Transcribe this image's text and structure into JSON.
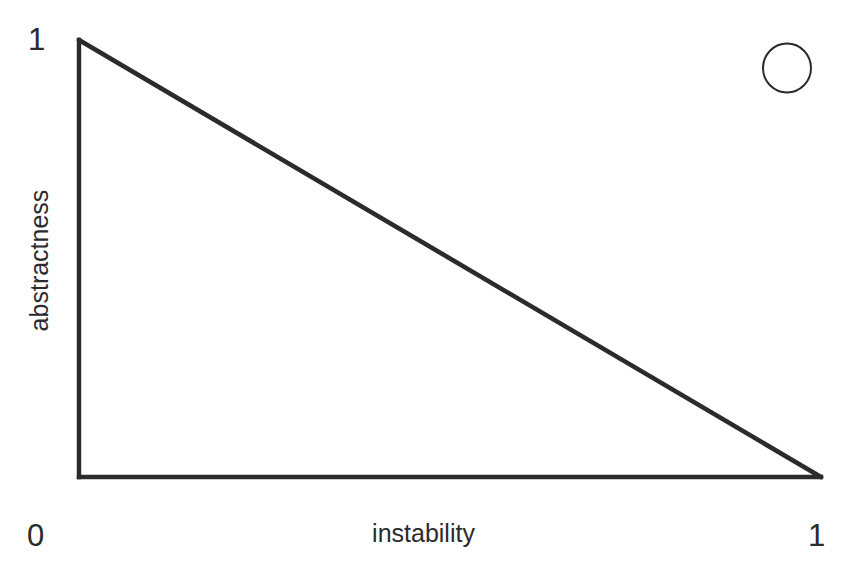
{
  "figure": {
    "background_color": "#ffffff",
    "stroke_color": "#2b2b2b",
    "width": 845,
    "height": 580
  },
  "axes": {
    "x_title": "instability",
    "y_title": "abstractness",
    "x_min_label": "0",
    "x_max_label": "1",
    "y_max_label": "1"
  },
  "marker": {
    "name": "empty-circle-marker",
    "shape": "circle",
    "filled": false
  },
  "chart_data": {
    "type": "line",
    "title": "",
    "subtitle": "",
    "xlabel": "instability",
    "ylabel": "abstractness",
    "xlim": [
      0,
      1
    ],
    "ylim": [
      0,
      1
    ],
    "xticks": [
      0,
      1
    ],
    "xticklabels": [
      "0",
      "1"
    ],
    "yticks": [
      1
    ],
    "yticklabels": [
      "1"
    ],
    "grid": false,
    "legend": null,
    "series": [
      {
        "name": "main sequence",
        "type": "line",
        "x": [
          0,
          1
        ],
        "y": [
          1,
          0
        ],
        "linewidth": 4,
        "color": "#2b2b2b"
      },
      {
        "name": "y-axis spine",
        "type": "line",
        "x": [
          0,
          0
        ],
        "y": [
          1,
          0
        ],
        "linewidth": 4,
        "color": "#2b2b2b"
      },
      {
        "name": "x-axis spine",
        "type": "line",
        "x": [
          0,
          1
        ],
        "y": [
          0,
          0
        ],
        "linewidth": 4,
        "color": "#2b2b2b"
      }
    ],
    "annotations": [
      {
        "name": "empty-circle-marker",
        "shape": "circle",
        "filled": false,
        "cx_px": 787,
        "cy_px": 68,
        "r_px": 24,
        "color": "#2b2b2b",
        "linewidth": 2
      }
    ]
  }
}
